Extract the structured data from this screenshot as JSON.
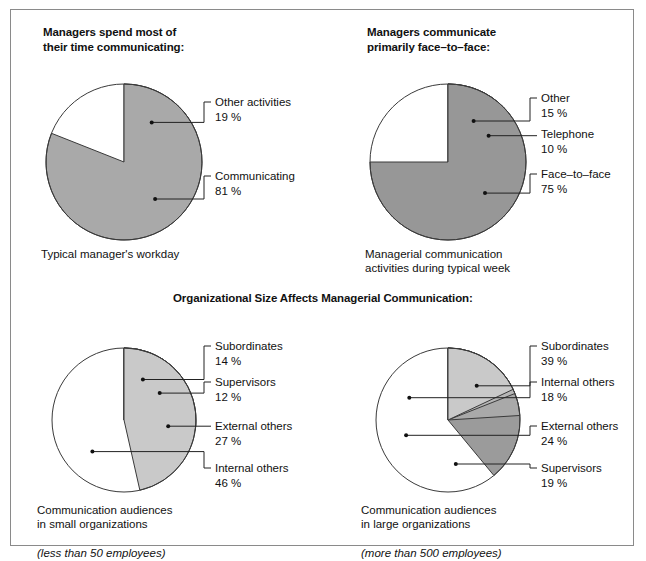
{
  "figure": {
    "border_color": "#8a8a8a",
    "background": "#ffffff"
  },
  "section_heading": "Organizational Size Affects Managerial Communication:",
  "panels": [
    {
      "id": "managers-time",
      "title": "Managers spend most of\ntheir time communicating:",
      "caption": "Typical manager's workday",
      "caption_italic": "",
      "chart_data": {
        "type": "pie",
        "title": "Managers spend most of their time communicating:",
        "start_angle_deg": 0,
        "direction": "clockwise",
        "categories": [
          "Other activities",
          "Communicating"
        ],
        "values": [
          19,
          81
        ],
        "value_labels": [
          "19 %",
          "81 %"
        ],
        "colors": [
          "#c6c6c6",
          "#a9a9a9"
        ],
        "legend": "callout-labels",
        "units": "percent"
      }
    },
    {
      "id": "face-to-face",
      "title": "Managers communicate\nprimarily face–to–face:",
      "caption": "Managerial communication\nactivities during typical week",
      "caption_italic": "",
      "chart_data": {
        "type": "pie",
        "title": "Managers communicate primarily face-to-face:",
        "start_angle_deg": 0,
        "direction": "clockwise",
        "categories": [
          "Other",
          "Telephone",
          "Face–to–face"
        ],
        "values": [
          15,
          10,
          75
        ],
        "value_labels": [
          "15 %",
          "10 %",
          "75 %"
        ],
        "colors": [
          "#c6c6c6",
          "#b4b4b4",
          "#979797"
        ],
        "legend": "callout-labels",
        "units": "percent"
      }
    },
    {
      "id": "small-organizations",
      "title": "",
      "caption": "Communication audiences\nin small organizations",
      "caption_italic": "(less than 50 employees)",
      "chart_data": {
        "type": "pie",
        "title": "Communication audiences in small organizations (less than 50 employees)",
        "start_angle_deg": 0,
        "direction": "clockwise",
        "categories": [
          "Subordinates",
          "Supervisors",
          "External others",
          "Internal others"
        ],
        "values": [
          14,
          12,
          27,
          46
        ],
        "value_labels": [
          "14 %",
          "12 %",
          "27 %",
          "46 %"
        ],
        "colors": [
          "#9a9a9a",
          "#b0b0b0",
          "#a8a8a8",
          "#c9c9c9"
        ],
        "legend": "callout-labels",
        "units": "percent"
      }
    },
    {
      "id": "large-organizations",
      "title": "",
      "caption": "Communication audiences\nin large organizations",
      "caption_italic": "(more than 500 employees)",
      "chart_data": {
        "type": "pie",
        "title": "Communication audiences in large organizations (more than 500 employees)",
        "start_angle_deg": 0,
        "direction": "clockwise",
        "categories": [
          "Subordinates",
          "External others",
          "Supervisors",
          "Internal others"
        ],
        "values": [
          39,
          24,
          19,
          18
        ],
        "value_labels": [
          "39 %",
          "24 %",
          "19 %",
          "18 %"
        ],
        "colors": [
          "#9b9b9b",
          "#a9a9a9",
          "#b6b6b6",
          "#c9c9c9"
        ],
        "legend": "callout-labels",
        "units": "percent"
      }
    }
  ],
  "chart_data": [
    {
      "type": "pie",
      "title": "Managers spend most of their time communicating:",
      "subtitle": "Typical manager's workday",
      "categories": [
        "Other activities",
        "Communicating"
      ],
      "values": [
        19,
        81
      ],
      "units": "percent"
    },
    {
      "type": "pie",
      "title": "Managers communicate primarily face-to-face:",
      "subtitle": "Managerial communication activities during typical week",
      "categories": [
        "Other",
        "Telephone",
        "Face-to-face"
      ],
      "values": [
        15,
        10,
        75
      ],
      "units": "percent"
    },
    {
      "type": "pie",
      "title": "Communication audiences in small organizations",
      "subtitle": "(less than 50 employees)",
      "categories": [
        "Subordinates",
        "Supervisors",
        "External others",
        "Internal others"
      ],
      "values": [
        14,
        12,
        27,
        46
      ],
      "units": "percent"
    },
    {
      "type": "pie",
      "title": "Communication audiences in large organizations",
      "subtitle": "(more than 500 employees)",
      "categories": [
        "Subordinates",
        "External others",
        "Supervisors",
        "Internal others"
      ],
      "values": [
        39,
        24,
        19,
        18
      ],
      "units": "percent"
    }
  ],
  "layout": {
    "panel_geometry": [
      {
        "cx": 113,
        "cy": 152,
        "r": 78,
        "label_x": 200,
        "label_rows": [
          [
            96,
            0
          ],
          [
            170,
            1
          ]
        ],
        "dot_angles": [
          35,
          140
        ]
      },
      {
        "cx": 437,
        "cy": 152,
        "r": 78,
        "label_x": 526,
        "label_rows": [
          [
            92,
            0
          ],
          [
            128,
            1
          ],
          [
            168,
            2
          ]
        ],
        "dot_angles": [
          32,
          57,
          130
        ]
      },
      {
        "cx": 113,
        "cy": 410,
        "r": 72,
        "label_x": 200,
        "label_rows": [
          [
            340,
            0
          ],
          [
            376,
            1
          ],
          [
            420,
            2
          ],
          [
            462,
            3
          ]
        ],
        "dot_angles": [
          25,
          53,
          98,
          225
        ]
      },
      {
        "cx": 437,
        "cy": 410,
        "r": 72,
        "label_x": 526,
        "label_rows": [
          [
            340,
            0
          ],
          [
            376,
            3
          ],
          [
            420,
            1
          ],
          [
            462,
            2
          ]
        ],
        "dot_angles": [
          40,
          300,
          250,
          170
        ]
      }
    ]
  }
}
